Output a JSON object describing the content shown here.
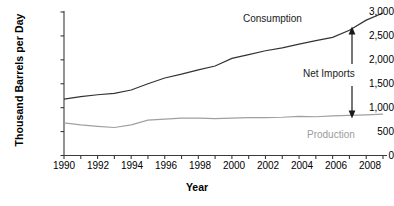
{
  "chart_data": {
    "type": "line",
    "title": "",
    "xlabel": "Year",
    "ylabel": "Thousand Barrels per Day",
    "xlim": [
      1990,
      2009
    ],
    "ylim": [
      0,
      3000
    ],
    "grid": false,
    "legend_position": "inline-annotations",
    "y_ticks": [
      0,
      500,
      1000,
      1500,
      2000,
      2500,
      3000
    ],
    "y_tick_labels": [
      "0",
      "500",
      "1,000",
      "1,500",
      "2,000",
      "2,500",
      "3,000"
    ],
    "x_ticks": [
      1990,
      1991,
      1992,
      1993,
      1994,
      1995,
      1996,
      1997,
      1998,
      1999,
      2000,
      2001,
      2002,
      2003,
      2004,
      2005,
      2006,
      2007,
      2008,
      2009
    ],
    "x_tick_labels": [
      "1990",
      "",
      "1992",
      "",
      "1994",
      "",
      "1996",
      "",
      "1998",
      "",
      "2000",
      "",
      "2002",
      "",
      "2004",
      "",
      "2006",
      "",
      "2008",
      ""
    ],
    "x_labeled_ticks": [
      {
        "year": 1990,
        "label": "1990"
      },
      {
        "year": 1992,
        "label": "1992"
      },
      {
        "year": 1994,
        "label": "1994"
      },
      {
        "year": 1996,
        "label": "1996"
      },
      {
        "year": 1998,
        "label": "1998"
      },
      {
        "year": 2000,
        "label": "2000"
      },
      {
        "year": 2002,
        "label": "2002"
      },
      {
        "year": 2004,
        "label": "2004"
      },
      {
        "year": 2006,
        "label": "2006"
      },
      {
        "year": 2008,
        "label": "2008"
      }
    ],
    "x": [
      1990,
      1991,
      1992,
      1993,
      1994,
      1995,
      1996,
      1997,
      1998,
      1999,
      2000,
      2001,
      2002,
      2003,
      2004,
      2005,
      2006,
      2007,
      2008,
      2009
    ],
    "series": [
      {
        "name": "Consumption",
        "color": "#333333",
        "values": [
          1180,
          1230,
          1270,
          1300,
          1370,
          1500,
          1620,
          1700,
          1790,
          1870,
          2030,
          2110,
          2190,
          2250,
          2330,
          2400,
          2470,
          2620,
          2830,
          2980
        ]
      },
      {
        "name": "Production",
        "color": "#a0a0a0",
        "values": [
          680,
          640,
          610,
          585,
          640,
          740,
          760,
          780,
          780,
          770,
          780,
          790,
          790,
          800,
          820,
          810,
          830,
          840,
          850,
          865
        ]
      }
    ],
    "annotations": [
      {
        "name": "Consumption",
        "text": "Consumption",
        "color": "#1a1a1a"
      },
      {
        "name": "Production",
        "text": "Production",
        "color": "#9c9c9c"
      },
      {
        "name": "Net Imports",
        "text": "Net Imports",
        "color": "#1a1a1a"
      }
    ]
  },
  "axes": {
    "y_title": "Thousand Barrels per Day",
    "x_title": "Year",
    "y_labels": {
      "t0": "0",
      "t500": "500",
      "t1000": "1,000",
      "t1500": "1,500",
      "t2000": "2,000",
      "t2500": "2,500",
      "t3000": "3,000"
    },
    "x_labels": {
      "y1990": "1990",
      "y1992": "1992",
      "y1994": "1994",
      "y1996": "1996",
      "y1998": "1998",
      "y2000": "2000",
      "y2002": "2002",
      "y2004": "2004",
      "y2006": "2006",
      "y2008": "2008"
    }
  },
  "labels": {
    "consumption": "Consumption",
    "production": "Production",
    "net_imports": "Net Imports"
  },
  "colors": {
    "consumption_line": "#333333",
    "production_line": "#a0a0a0",
    "axis": "#3a3a3a",
    "text": "#000000",
    "production_text": "#9c9c9c",
    "background": "#ffffff"
  }
}
